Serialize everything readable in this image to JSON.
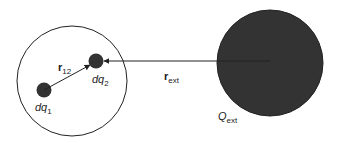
{
  "diagram": {
    "colors": {
      "background": "#ffffff",
      "stroke": "#222222",
      "charge_fill": "#333333",
      "external_charge_fill": "#333333"
    },
    "region": {
      "label": ""
    },
    "charges": [
      {
        "id": "dq1",
        "label_main": "dq",
        "label_sub": "1"
      },
      {
        "id": "dq2",
        "label_main": "dq",
        "label_sub": "2"
      },
      {
        "id": "Qext",
        "label_main": "Q",
        "label_sub": "ext"
      }
    ],
    "vectors": [
      {
        "id": "r12",
        "label_main": "r",
        "label_sub": "12",
        "from": "dq1",
        "to": "dq2"
      },
      {
        "id": "rext",
        "label_main": "r",
        "label_sub": "ext",
        "from": "Qext",
        "to": "dq2"
      }
    ]
  }
}
